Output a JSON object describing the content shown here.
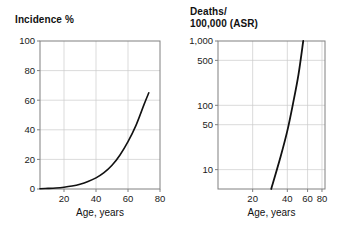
{
  "figure": {
    "background_color": "#ffffff",
    "frame_color": "#808080",
    "grid_color": "#cccccc",
    "curve_color": "#111111",
    "text_color": "#111111"
  },
  "chart_data": [
    {
      "id": "incidence",
      "type": "line",
      "title": "Incidence %",
      "xlabel": "Age, years",
      "ylabel": "",
      "xscale": "linear",
      "yscale": "linear",
      "xlim": [
        5,
        80
      ],
      "ylim": [
        0,
        100
      ],
      "xticks": [
        20,
        40,
        60,
        80
      ],
      "xticklabels": [
        "20",
        "40",
        "60",
        "80"
      ],
      "yticks": [
        0,
        20,
        40,
        60,
        80,
        100
      ],
      "yticklabels": [
        "0",
        "20",
        "40",
        "60",
        "80",
        "100"
      ],
      "grid": true,
      "legend": "none",
      "series": [
        {
          "name": "Incidence",
          "x": [
            5,
            10,
            15,
            20,
            25,
            30,
            35,
            40,
            45,
            50,
            55,
            60,
            65,
            70,
            73
          ],
          "values": [
            0.2,
            0.4,
            0.7,
            1.2,
            2.0,
            3.2,
            5.0,
            7.5,
            11.0,
            16.0,
            23.0,
            32.0,
            43.0,
            57.0,
            65.0
          ]
        }
      ]
    },
    {
      "id": "deaths",
      "type": "line",
      "title": "Deaths/\n100,000 (ASR)",
      "xlabel": "Age, years",
      "ylabel": "",
      "xscale": "log",
      "yscale": "log",
      "xlim": [
        10,
        85
      ],
      "ylim": [
        5,
        1000
      ],
      "xticks": [
        20,
        40,
        60,
        80
      ],
      "xticklabels": [
        "20",
        "40",
        "60",
        "80"
      ],
      "yticks": [
        10,
        50,
        100,
        500,
        1000
      ],
      "yticklabels": [
        "10",
        "50",
        "100",
        "500",
        "1,000"
      ],
      "grid": true,
      "legend": "none",
      "series": [
        {
          "name": "Deaths per 100,000 (ASR)",
          "x": [
            29,
            35,
            40,
            45,
            50,
            55
          ],
          "values": [
            5,
            16,
            40,
            110,
            300,
            1000
          ]
        }
      ]
    }
  ]
}
